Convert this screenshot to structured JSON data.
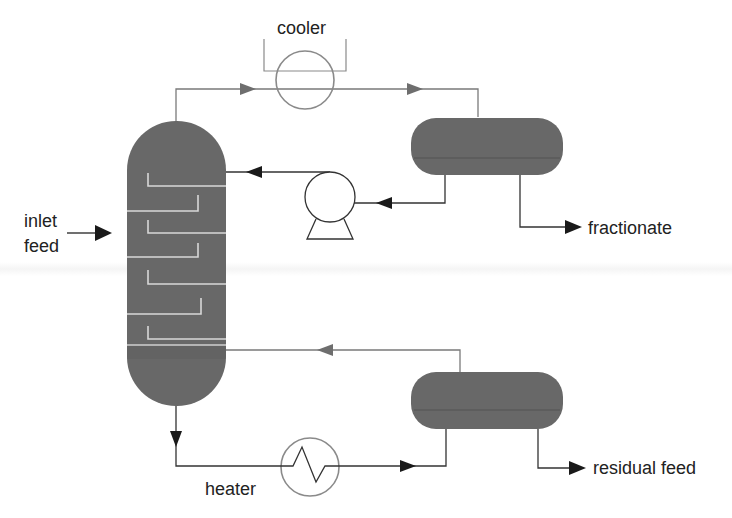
{
  "diagram": {
    "type": "process-flow",
    "colors": {
      "vessel_fill": "#6a6a6a",
      "vessel_fill_dark": "#5e5e5e",
      "tray_line": "#d8d8d8",
      "pipe_gray": "#7a7a7a",
      "pipe_dark": "#333333",
      "arrow_dark": "#1a1a1a",
      "arrow_gray": "#6e6e6e",
      "exchanger_stroke": "#8a8a8a",
      "text": "#222222"
    },
    "labels": {
      "cooler": "cooler",
      "inlet": "inlet",
      "feed": "feed",
      "fractionate": "fractionate",
      "heater": "heater",
      "residual_feed": "residual feed"
    },
    "components": [
      {
        "id": "column",
        "name": "distillation column",
        "trays": 7
      },
      {
        "id": "cooler",
        "name": "cooler",
        "symbol": "heat-exchanger-circle"
      },
      {
        "id": "reflux-drum",
        "name": "overhead accumulator"
      },
      {
        "id": "pump",
        "name": "reflux pump"
      },
      {
        "id": "heater",
        "name": "heater",
        "symbol": "heat-exchanger-zigzag"
      },
      {
        "id": "bottoms-drum",
        "name": "bottoms drum"
      }
    ],
    "streams": [
      {
        "from": "inlet feed",
        "to": "column"
      },
      {
        "from": "column top",
        "to": "cooler"
      },
      {
        "from": "cooler",
        "to": "reflux-drum"
      },
      {
        "from": "reflux-drum",
        "to": "pump"
      },
      {
        "from": "pump",
        "to": "column"
      },
      {
        "from": "reflux-drum",
        "to": "fractionate"
      },
      {
        "from": "column bottom",
        "to": "heater"
      },
      {
        "from": "heater",
        "to": "bottoms-drum"
      },
      {
        "from": "bottoms-drum",
        "to": "column"
      },
      {
        "from": "bottoms-drum",
        "to": "residual feed"
      }
    ]
  }
}
